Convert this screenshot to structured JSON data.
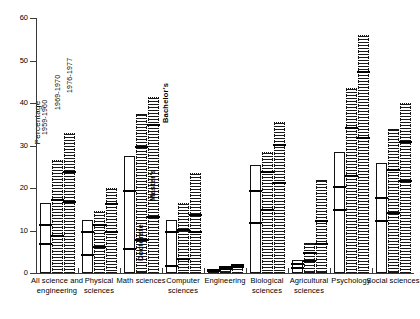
{
  "chart_data": {
    "type": "bar",
    "title": "",
    "subtitle": "",
    "xlabel": "",
    "ylabel": "Percentage",
    "ylim": [
      0,
      60
    ],
    "yticks": [
      0,
      10,
      20,
      30,
      40,
      50,
      60
    ],
    "ytick_labels": [
      "0",
      "10",
      "20",
      "30",
      "40",
      "50",
      "60"
    ],
    "grid": false,
    "legend_position": "in-plot-annotations",
    "series_labels": [
      "1959-1960",
      "1969-1970",
      "1976-1977"
    ],
    "level_labels": [
      "Doctorate",
      "Master's",
      "Bachelor's"
    ],
    "note": "Each bar is capped at its Bachelor's percentage; internal horizontal marks show the Doctorate and Master's percentages for the same year.",
    "categories": [
      "All science and engineering",
      "Physical sciences",
      "Math sciences",
      "Computer sciences",
      "Engineering",
      "Biological sciences",
      "Agricultural sciences",
      "Psychology",
      "Social sciences"
    ],
    "groups": [
      {
        "category": "All science and engineering",
        "bars": [
          {
            "year": "1959-1960",
            "bachelors": 16.5,
            "masters": 11.0,
            "doctorate": 6.5
          },
          {
            "year": "1969-1970",
            "bachelors": 26.5,
            "masters": 17.0,
            "doctorate": 8.5
          },
          {
            "year": "1976-1977",
            "bachelors": 33.0,
            "masters": 23.5,
            "doctorate": 16.5
          }
        ]
      },
      {
        "category": "Physical sciences",
        "bars": [
          {
            "year": "1959-1960",
            "bachelors": 12.5,
            "masters": 9.5,
            "doctorate": 4.0
          },
          {
            "year": "1969-1970",
            "bachelors": 14.5,
            "masters": 11.0,
            "doctorate": 6.0
          },
          {
            "year": "1976-1977",
            "bachelors": 20.0,
            "masters": 16.0,
            "doctorate": 9.5
          }
        ]
      },
      {
        "category": "Math sciences",
        "bars": [
          {
            "year": "1959-1960",
            "bachelors": 27.5,
            "masters": 19.0,
            "doctorate": 5.5
          },
          {
            "year": "1969-1970",
            "bachelors": 37.5,
            "masters": 29.5,
            "doctorate": 7.5
          },
          {
            "year": "1976-1977",
            "bachelors": 41.5,
            "masters": 34.5,
            "doctorate": 13.0
          }
        ]
      },
      {
        "category": "Computer sciences",
        "bars": [
          {
            "year": "1959-1960",
            "bachelors": 12.5,
            "masters": 9.5,
            "doctorate": 1.5
          },
          {
            "year": "1969-1970",
            "bachelors": 16.5,
            "masters": 10.0,
            "doctorate": 3.0
          },
          {
            "year": "1976-1977",
            "bachelors": 23.5,
            "masters": 13.5,
            "doctorate": 9.5
          }
        ]
      },
      {
        "category": "Engineering",
        "bars": [
          {
            "year": "1959-1960",
            "bachelors": 0.5,
            "masters": 0.4,
            "doctorate": 0.2
          },
          {
            "year": "1969-1970",
            "bachelors": 1.5,
            "masters": 1.1,
            "doctorate": 0.6
          },
          {
            "year": "1976-1977",
            "bachelors": 2.0,
            "masters": 1.6,
            "doctorate": 1.2
          }
        ]
      },
      {
        "category": "Biological sciences",
        "bars": [
          {
            "year": "1959-1960",
            "bachelors": 25.5,
            "masters": 19.0,
            "doctorate": 11.5
          },
          {
            "year": "1969-1970",
            "bachelors": 28.5,
            "masters": 23.5,
            "doctorate": 14.5
          },
          {
            "year": "1976-1977",
            "bachelors": 35.5,
            "masters": 30.0,
            "doctorate": 21.0
          }
        ]
      },
      {
        "category": "Agricultural sciences",
        "bars": [
          {
            "year": "1959-1960",
            "bachelors": 3.0,
            "masters": 2.0,
            "doctorate": 1.0
          },
          {
            "year": "1969-1970",
            "bachelors": 7.0,
            "masters": 4.5,
            "doctorate": 2.5
          },
          {
            "year": "1976-1977",
            "bachelors": 22.0,
            "masters": 12.0,
            "doctorate": 6.5
          }
        ]
      },
      {
        "category": "Psychology",
        "bars": [
          {
            "year": "1959-1960",
            "bachelors": 28.5,
            "masters": 20.0,
            "doctorate": 14.5
          },
          {
            "year": "1969-1970",
            "bachelors": 43.5,
            "masters": 34.0,
            "doctorate": 22.5
          },
          {
            "year": "1976-1977",
            "bachelors": 56.0,
            "masters": 47.0,
            "doctorate": 31.5
          }
        ]
      },
      {
        "category": "Social sciences",
        "bars": [
          {
            "year": "1959-1960",
            "bachelors": 26.0,
            "masters": 17.5,
            "doctorate": 12.0
          },
          {
            "year": "1969-1970",
            "bachelors": 34.0,
            "masters": 24.0,
            "doctorate": 14.0
          },
          {
            "year": "1976-1977",
            "bachelors": 40.0,
            "masters": 30.5,
            "doctorate": 21.5
          }
        ]
      }
    ]
  }
}
